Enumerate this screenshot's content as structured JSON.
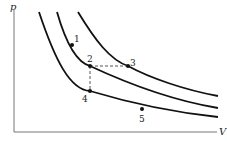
{
  "diagram": {
    "type": "p-V diagram with three isotherms",
    "axes": {
      "y_label": "p",
      "x_label": "V",
      "color": "#777777"
    },
    "curves": [
      {
        "name": "isotherm-low",
        "path": "M39,12 C55,60 70,90 90,91 C120,100 170,112 218,117"
      },
      {
        "name": "isotherm-mid",
        "path": "M57,12 C65,40 75,62 90,66 C120,80 170,100 218,108"
      },
      {
        "name": "isotherm-high",
        "path": "M78,12 C95,40 110,60 128,66 C150,78 185,90 218,96"
      }
    ],
    "points": [
      {
        "label": "1",
        "x": 72,
        "y": 45,
        "lx": 74,
        "ly": 42
      },
      {
        "label": "2",
        "x": 90,
        "y": 66,
        "lx": 87,
        "ly": 62
      },
      {
        "label": "3",
        "x": 128,
        "y": 66,
        "lx": 130,
        "ly": 66
      },
      {
        "label": "4",
        "x": 90,
        "y": 91,
        "lx": 82,
        "ly": 102
      },
      {
        "label": "5",
        "x": 142,
        "y": 109,
        "lx": 139,
        "ly": 122
      }
    ],
    "dashed": [
      {
        "x1": 90,
        "y1": 66,
        "x2": 128,
        "y2": 66
      },
      {
        "x1": 90,
        "y1": 66,
        "x2": 90,
        "y2": 91
      }
    ],
    "curve_color": "#111111"
  }
}
